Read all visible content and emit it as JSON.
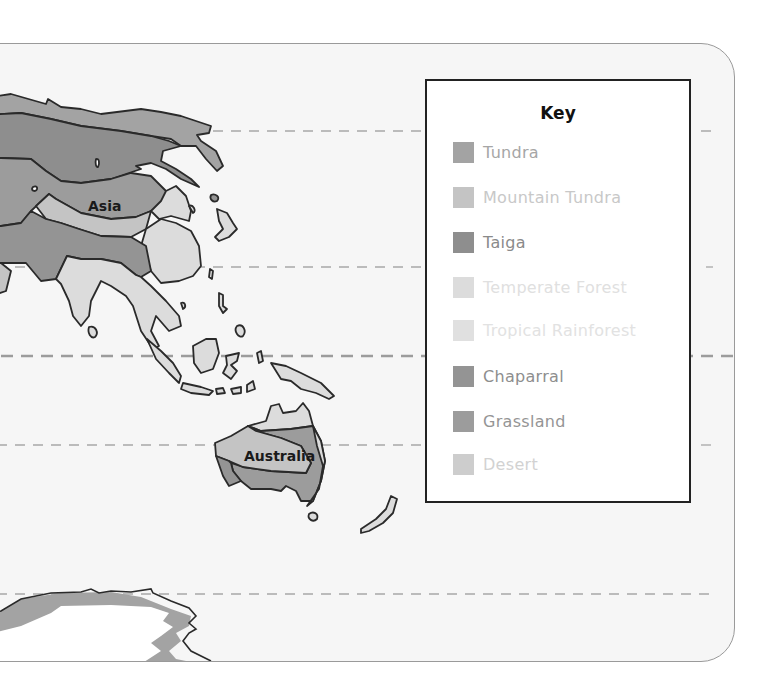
{
  "map": {
    "type": "biome map",
    "regions": [
      {
        "name": "Asia",
        "label": "Asia"
      },
      {
        "name": "Australia",
        "label": "Australia"
      }
    ],
    "latitude_lines": [
      "dashed",
      "dashed",
      "equator",
      "dashed",
      "dashed"
    ]
  },
  "key": {
    "title": "Key",
    "items": [
      {
        "label": "Tundra",
        "swatch_color": "#a3a3a3",
        "text_color": "#a6a6a6"
      },
      {
        "label": "Mountain Tundra",
        "swatch_color": "#c4c4c4",
        "text_color": "#c8c8c8"
      },
      {
        "label": "Taiga",
        "swatch_color": "#8e8e8e",
        "text_color": "#8a8a8a"
      },
      {
        "label": "Temperate Forest",
        "swatch_color": "#dcdcdc",
        "text_color": "#e0e0e0"
      },
      {
        "label": "Tropical Rainforest",
        "swatch_color": "#e0e0e0",
        "text_color": "#e2e2e2"
      },
      {
        "label": "Chaparral",
        "swatch_color": "#949494",
        "text_color": "#8e8e8e"
      },
      {
        "label": "Grassland",
        "swatch_color": "#9c9c9c",
        "text_color": "#959595"
      },
      {
        "label": "Desert",
        "swatch_color": "#cdcdcd",
        "text_color": "#d2d2d2"
      }
    ]
  }
}
